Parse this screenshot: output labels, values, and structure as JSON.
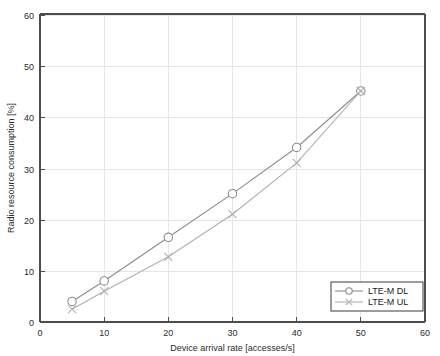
{
  "chart_data": {
    "type": "line",
    "title": "",
    "xlabel": "Device arrival rate [accesses/s]",
    "ylabel": "Radio resource consumption [%]",
    "xlim": [
      0,
      60
    ],
    "ylim": [
      0,
      60
    ],
    "xticks": [
      0,
      10,
      20,
      30,
      40,
      50,
      60
    ],
    "yticks": [
      0,
      10,
      20,
      30,
      40,
      50,
      60
    ],
    "xtick_labels": [
      "0",
      "10",
      "20",
      "30",
      "40",
      "50",
      "60"
    ],
    "ytick_labels": [
      "0",
      "10",
      "20",
      "30",
      "40",
      "50",
      "60"
    ],
    "grid": true,
    "legend_position": "lower right",
    "x": [
      5,
      10,
      20,
      30,
      40,
      50
    ],
    "series": [
      {
        "name": "LTE-M DL",
        "values": [
          4,
          8,
          16.5,
          25,
          34,
          45
        ],
        "color": "#8c8c8c",
        "marker": "circle"
      },
      {
        "name": "LTE-M UL",
        "values": [
          2.5,
          6,
          12.7,
          21,
          31,
          45
        ],
        "color": "#b0b0b0",
        "marker": "x"
      }
    ]
  },
  "legend": {
    "entries": [
      {
        "label": "LTE-M DL",
        "marker": "circle-marker",
        "color": "#8c8c8c"
      },
      {
        "label": "LTE-M UL",
        "marker": "x-marker",
        "color": "#b0b0b0"
      }
    ]
  },
  "axes": {
    "x_label": "Device arrival rate [accesses/s]",
    "y_label": "Radio resource consumption [%]",
    "x_ticks": [
      "0",
      "10",
      "20",
      "30",
      "40",
      "50",
      "60"
    ],
    "y_ticks": [
      "0",
      "10",
      "20",
      "30",
      "40",
      "50",
      "60"
    ]
  },
  "colors": {
    "background": "#ffffff",
    "grid": "#e6e6e6",
    "axis": "#4d4d4d",
    "series_dl": "#8c8c8c",
    "series_ul": "#b0b0b0",
    "text": "#2b2b2b"
  }
}
